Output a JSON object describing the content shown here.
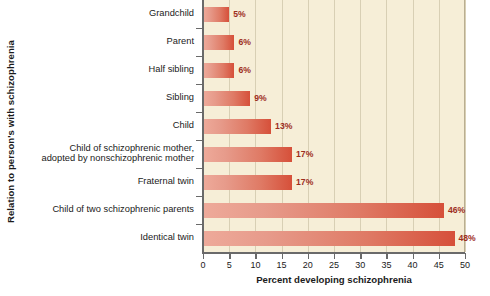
{
  "chart_data": {
    "type": "bar",
    "orientation": "horizontal",
    "title": "",
    "xlabel": "Percent developing schizophrenia",
    "ylabel": "Relation to person's with schizophrenia",
    "xlim": [
      0,
      50
    ],
    "xticks": [
      "0",
      "5",
      "10",
      "15",
      "20",
      "25",
      "30",
      "35",
      "40",
      "45",
      "50"
    ],
    "grid": "vertical",
    "legend": "none",
    "categories": [
      "Grandchild",
      "Parent",
      "Half sibling",
      "Sibling",
      "Child",
      "Child of schizophrenic mother,\nadopted by nonschizophrenic mother",
      "Fraternal twin",
      "Child of two schizophrenic parents",
      "Identical twin"
    ],
    "values": [
      5,
      6,
      6,
      9,
      13,
      17,
      17,
      46,
      48
    ],
    "value_labels": [
      "5%",
      "6%",
      "6%",
      "9%",
      "13%",
      "17%",
      "17%",
      "46%",
      "48%"
    ]
  },
  "colors": {
    "plot_background": "#f6eed7",
    "gridline": "#d8cfb4",
    "axis": "#6a6a6a",
    "bar_light": "#eeaa9a",
    "bar_dark": "#d6503a",
    "value_label": "#9d2d1c",
    "text": "#1a1a1a",
    "page_background": "#ffffff"
  }
}
